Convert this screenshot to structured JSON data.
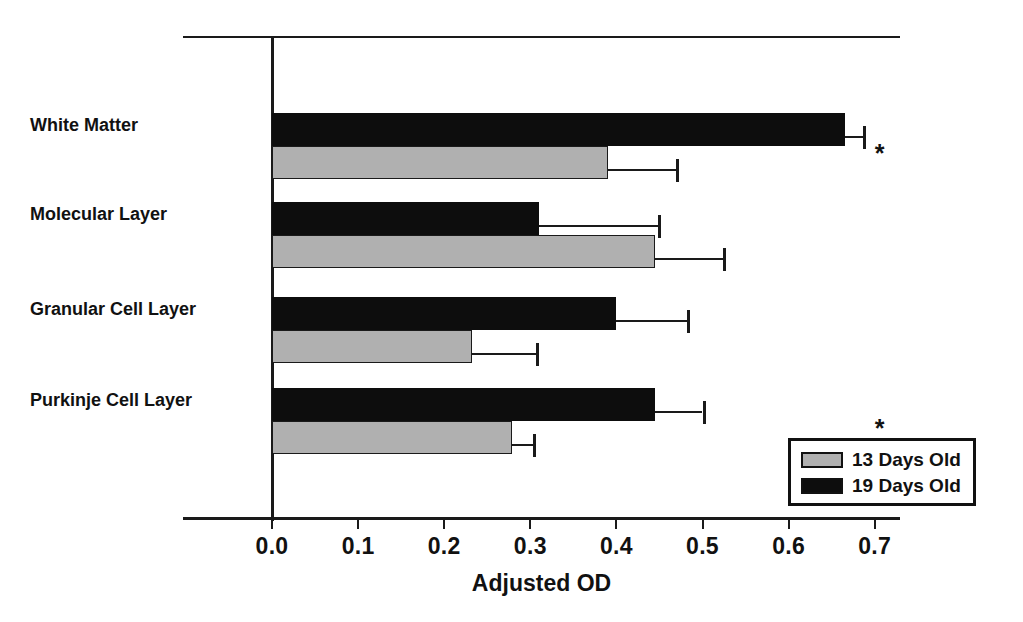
{
  "chart_data": {
    "type": "bar",
    "orientation": "horizontal",
    "title": "",
    "xlabel": "Adjusted OD",
    "ylabel": "",
    "xlim": [
      0.0,
      0.73
    ],
    "xticks": [
      0.0,
      0.1,
      0.2,
      0.3,
      0.4,
      0.5,
      0.6,
      0.7
    ],
    "xtick_labels": [
      "0.0",
      "0.1",
      "0.2",
      "0.3",
      "0.4",
      "0.5",
      "0.6",
      "0.7"
    ],
    "grid": false,
    "legend_position": "bottom-right",
    "categories": [
      "White Matter",
      "Molecular Layer",
      "Granular Cell Layer",
      "Purkinje Cell Layer"
    ],
    "series": [
      {
        "name": "13 Days Old",
        "color": "#b0b0b0",
        "values": [
          0.39,
          0.445,
          0.232,
          0.279
        ],
        "errors": [
          0.079,
          0.079,
          0.075,
          0.024
        ]
      },
      {
        "name": "19 Days Old",
        "color": "#0d0d0d",
        "values": [
          0.665,
          0.31,
          0.4,
          0.445
        ],
        "errors": [
          0.021,
          0.138,
          0.082,
          0.055
        ]
      }
    ],
    "annotations": [
      {
        "text": "*",
        "category": "White Matter",
        "x": 0.7
      },
      {
        "text": "*",
        "category": "Purkinje Cell Layer",
        "x": 0.7
      }
    ]
  },
  "axis": {
    "xlabel": "Adjusted OD",
    "tick_labels": [
      "0.0",
      "0.1",
      "0.2",
      "0.3",
      "0.4",
      "0.5",
      "0.6",
      "0.7"
    ]
  },
  "categories": [
    {
      "label": "White Matter"
    },
    {
      "label": "Molecular Layer"
    },
    {
      "label": "Granular Cell Layer"
    },
    {
      "label": "Purkinje Cell Layer"
    }
  ],
  "legend": {
    "entries": [
      {
        "label": "13 Days Old",
        "color": "#b0b0b0"
      },
      {
        "label": "19 Days Old",
        "color": "#0d0d0d"
      }
    ]
  },
  "significance": {
    "marker": "*"
  }
}
